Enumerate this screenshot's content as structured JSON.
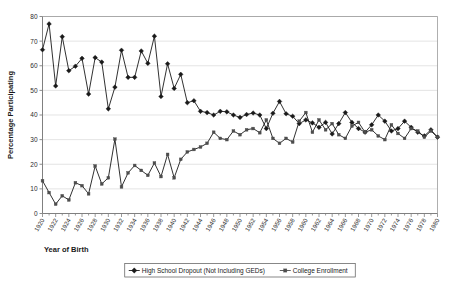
{
  "chart_data": {
    "type": "line",
    "title": "",
    "xlabel": "Year of Birth",
    "ylabel": "Percentage Participating",
    "xlim": [
      1920,
      1980
    ],
    "ylim": [
      0,
      80
    ],
    "ytick_step": 10,
    "xtick_step": 2,
    "grid": true,
    "legend_position": "bottom",
    "yticks": [
      0,
      10,
      20,
      30,
      40,
      50,
      60,
      70,
      80
    ],
    "xticks": [
      1920,
      1922,
      1924,
      1926,
      1928,
      1930,
      1932,
      1934,
      1936,
      1938,
      1940,
      1942,
      1944,
      1946,
      1948,
      1950,
      1952,
      1954,
      1956,
      1958,
      1960,
      1962,
      1964,
      1966,
      1968,
      1970,
      1972,
      1974,
      1976,
      1978,
      1980
    ],
    "x": [
      1920,
      1921,
      1922,
      1923,
      1924,
      1925,
      1926,
      1927,
      1928,
      1929,
      1930,
      1931,
      1932,
      1933,
      1934,
      1935,
      1936,
      1937,
      1938,
      1939,
      1940,
      1941,
      1942,
      1943,
      1944,
      1945,
      1946,
      1947,
      1948,
      1949,
      1950,
      1951,
      1952,
      1953,
      1954,
      1955,
      1956,
      1957,
      1958,
      1959,
      1960,
      1961,
      1962,
      1963,
      1964,
      1965,
      1966,
      1967,
      1968,
      1969,
      1970,
      1971,
      1972,
      1973,
      1974,
      1975,
      1976,
      1977,
      1978,
      1979,
      1980
    ],
    "series": [
      {
        "name": "High School Dropout (Not Including GEDs)",
        "marker": "diamond",
        "color": "#1a1a1a",
        "values": [
          66.5,
          77.0,
          51.8,
          71.8,
          58.0,
          59.8,
          63.0,
          48.5,
          63.3,
          61.5,
          42.5,
          51.3,
          66.3,
          55.3,
          55.3,
          66.0,
          61.0,
          72.0,
          47.5,
          60.8,
          50.8,
          56.5,
          45.0,
          45.8,
          41.5,
          41.0,
          40.0,
          41.5,
          41.3,
          40.0,
          39.0,
          40.2,
          40.8,
          40.0,
          34.5,
          40.7,
          45.5,
          40.5,
          39.5,
          36.5,
          38.0,
          36.8,
          35.0,
          37.0,
          32.3,
          36.5,
          41.0,
          37.0,
          34.5,
          33.0,
          36.0,
          40.0,
          37.5,
          33.5,
          34.5,
          37.5,
          35.0,
          33.0,
          31.5,
          34.0,
          31.0
        ]
      },
      {
        "name": "College Enrollment",
        "marker": "square",
        "color": "#4d4d4d",
        "values": [
          13.3,
          8.5,
          3.8,
          7.2,
          5.5,
          12.5,
          11.3,
          8.0,
          19.3,
          12.0,
          14.5,
          30.2,
          10.8,
          16.5,
          19.5,
          17.5,
          15.5,
          20.5,
          15.0,
          24.0,
          14.5,
          22.0,
          25.0,
          26.0,
          27.0,
          28.5,
          33.0,
          30.5,
          30.0,
          33.5,
          32.0,
          34.0,
          34.5,
          32.8,
          38.0,
          30.5,
          28.5,
          30.5,
          29.0,
          37.5,
          41.0,
          33.0,
          38.0,
          34.0,
          36.5,
          32.0,
          30.5,
          35.5,
          37.0,
          33.0,
          34.0,
          31.5,
          30.0,
          36.0,
          32.5,
          30.5,
          34.5,
          33.5,
          31.0,
          33.5,
          31.0
        ]
      }
    ]
  },
  "legend": {
    "entries": [
      {
        "label": "High School Dropout (Not Including GEDs)",
        "marker": "diamond"
      },
      {
        "label": "College Enrollment",
        "marker": "square"
      }
    ]
  }
}
